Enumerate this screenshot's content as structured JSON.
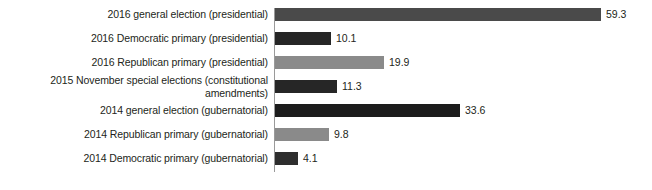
{
  "chart_data": {
    "type": "bar",
    "orientation": "horizontal",
    "title": "",
    "subtitle": "",
    "xlabel": "",
    "ylabel": "",
    "xlim": [
      0,
      59.3
    ],
    "grid": false,
    "legend": "none",
    "axis_line_color": "#9a9a9a",
    "background_color": "#ffffff",
    "categories": [
      "2016 general election (presidential)",
      "2016 Democratic primary (presidential)",
      "2016 Republican primary (presidential)",
      "2015 November special elections (constitutional amendments)",
      "2014 general election (gubernatorial)",
      "2014 Republican primary (gubernatorial)",
      "2014 Democratic primary (gubernatorial)"
    ],
    "values": [
      59.3,
      10.1,
      19.9,
      11.3,
      33.6,
      9.8,
      4.1
    ],
    "value_labels": [
      "59.3",
      "10.1",
      "19.9",
      "11.3",
      "33.6",
      "9.8",
      "4.1"
    ],
    "bar_colors": [
      "#4a4a4a",
      "#262626",
      "#8a8a8a",
      "#262626",
      "#1c1c1c",
      "#8a8a8a",
      "#2e2e2e"
    ],
    "bars": [
      {
        "category": "2016 general election (presidential)",
        "value": 59.3,
        "value_label": "59.3",
        "color": "#4a4a4a",
        "wraps": false
      },
      {
        "category": "2016 Democratic primary (presidential)",
        "value": 10.1,
        "value_label": "10.1",
        "color": "#262626",
        "wraps": false
      },
      {
        "category": "2016 Republican primary (presidential)",
        "value": 19.9,
        "value_label": "19.9",
        "color": "#8a8a8a",
        "wraps": false
      },
      {
        "category": "2015 November special elections (constitutional amendments)",
        "value": 11.3,
        "value_label": "11.3",
        "color": "#262626",
        "wraps": true
      },
      {
        "category": "2014 general election (gubernatorial)",
        "value": 33.6,
        "value_label": "33.6",
        "color": "#1c1c1c",
        "wraps": false
      },
      {
        "category": "2014 Republican primary (gubernatorial)",
        "value": 9.8,
        "value_label": "9.8",
        "color": "#8a8a8a",
        "wraps": false
      },
      {
        "category": "2014 Democratic primary (gubernatorial)",
        "value": 4.1,
        "value_label": "4.1",
        "color": "#2e2e2e",
        "wraps": false
      }
    ]
  }
}
